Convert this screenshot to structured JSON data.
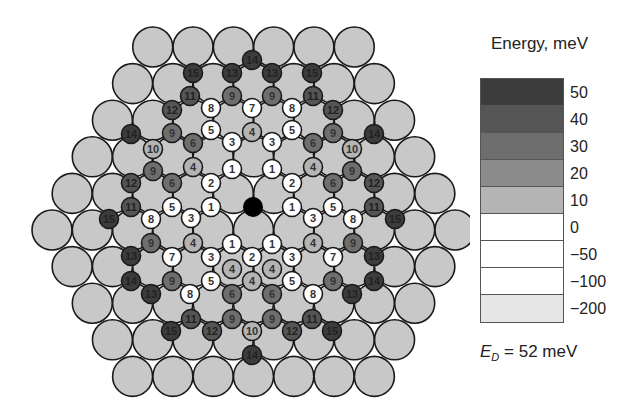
{
  "legend": {
    "title": "Energy, meV",
    "bins": [
      {
        "label": "50",
        "color": "#3c3c3c"
      },
      {
        "label": "40",
        "color": "#555555"
      },
      {
        "label": "30",
        "color": "#6e6e6e"
      },
      {
        "label": "20",
        "color": "#8c8c8c"
      },
      {
        "label": "10",
        "color": "#b4b4b4"
      },
      {
        "label": "0",
        "color": "#ffffff"
      },
      {
        "label": "−50",
        "color": "#ffffff"
      },
      {
        "label": "−100",
        "color": "#ffffff"
      },
      {
        "label": "−200",
        "color": "#e6e6e6"
      }
    ],
    "ed_symbol": "E",
    "ed_sub": "D",
    "ed_value": "= 52 meV"
  },
  "lattice": {
    "substrate_color": "#c8c8c8",
    "row_counts": [
      6,
      7,
      8,
      9,
      10,
      11,
      10,
      9,
      8,
      7
    ],
    "top_y": 47,
    "row_step": 36.6,
    "col_step": 40.3,
    "center_x": 253.5,
    "radius": 20
  },
  "center_atom": {
    "x": 253,
    "y": 207,
    "color": "#000000"
  },
  "sites": [
    {
      "x": 252,
      "y": 60,
      "n": 14
    },
    {
      "x": 193,
      "y": 73,
      "n": 15
    },
    {
      "x": 232,
      "y": 73,
      "n": 13
    },
    {
      "x": 272,
      "y": 73,
      "n": 13
    },
    {
      "x": 312,
      "y": 73,
      "n": 15
    },
    {
      "x": 190,
      "y": 96,
      "n": 11
    },
    {
      "x": 232,
      "y": 96,
      "n": 9
    },
    {
      "x": 272,
      "y": 96,
      "n": 9
    },
    {
      "x": 313,
      "y": 96,
      "n": 11
    },
    {
      "x": 172,
      "y": 110,
      "n": 12
    },
    {
      "x": 211,
      "y": 108,
      "n": 8
    },
    {
      "x": 252,
      "y": 108,
      "n": 7
    },
    {
      "x": 292,
      "y": 108,
      "n": 8
    },
    {
      "x": 333,
      "y": 110,
      "n": 12
    },
    {
      "x": 131,
      "y": 134,
      "n": 14
    },
    {
      "x": 172,
      "y": 133,
      "n": 9
    },
    {
      "x": 211,
      "y": 130,
      "n": 5
    },
    {
      "x": 252,
      "y": 132,
      "n": 4
    },
    {
      "x": 292,
      "y": 130,
      "n": 5
    },
    {
      "x": 333,
      "y": 133,
      "n": 9
    },
    {
      "x": 374,
      "y": 134,
      "n": 14
    },
    {
      "x": 153,
      "y": 149,
      "n": 10
    },
    {
      "x": 193,
      "y": 143,
      "n": 6
    },
    {
      "x": 232,
      "y": 142,
      "n": 3
    },
    {
      "x": 272,
      "y": 142,
      "n": 3
    },
    {
      "x": 313,
      "y": 143,
      "n": 6
    },
    {
      "x": 352,
      "y": 149,
      "n": 10
    },
    {
      "x": 153,
      "y": 171,
      "n": 9
    },
    {
      "x": 193,
      "y": 167,
      "n": 4
    },
    {
      "x": 232,
      "y": 169,
      "n": 1
    },
    {
      "x": 272,
      "y": 169,
      "n": 1
    },
    {
      "x": 313,
      "y": 167,
      "n": 4
    },
    {
      "x": 352,
      "y": 171,
      "n": 9
    },
    {
      "x": 131,
      "y": 183,
      "n": 12
    },
    {
      "x": 172,
      "y": 183,
      "n": 6
    },
    {
      "x": 211,
      "y": 183,
      "n": 2
    },
    {
      "x": 292,
      "y": 183,
      "n": 2
    },
    {
      "x": 333,
      "y": 183,
      "n": 6
    },
    {
      "x": 374,
      "y": 183,
      "n": 12
    },
    {
      "x": 131,
      "y": 207,
      "n": 11
    },
    {
      "x": 172,
      "y": 207,
      "n": 5
    },
    {
      "x": 211,
      "y": 207,
      "n": 1
    },
    {
      "x": 292,
      "y": 207,
      "n": 1
    },
    {
      "x": 333,
      "y": 207,
      "n": 5
    },
    {
      "x": 374,
      "y": 207,
      "n": 11
    },
    {
      "x": 109,
      "y": 219,
      "n": 15
    },
    {
      "x": 151,
      "y": 219,
      "n": 8
    },
    {
      "x": 191,
      "y": 218,
      "n": 3
    },
    {
      "x": 313,
      "y": 218,
      "n": 3
    },
    {
      "x": 353,
      "y": 219,
      "n": 8
    },
    {
      "x": 395,
      "y": 219,
      "n": 15
    },
    {
      "x": 232,
      "y": 244,
      "n": 1
    },
    {
      "x": 272,
      "y": 244,
      "n": 1
    },
    {
      "x": 151,
      "y": 243,
      "n": 9
    },
    {
      "x": 193,
      "y": 243,
      "n": 4
    },
    {
      "x": 313,
      "y": 243,
      "n": 4
    },
    {
      "x": 353,
      "y": 243,
      "n": 9
    },
    {
      "x": 131,
      "y": 256,
      "n": 13
    },
    {
      "x": 172,
      "y": 257,
      "n": 7
    },
    {
      "x": 211,
      "y": 257,
      "n": 3
    },
    {
      "x": 252,
      "y": 257,
      "n": 2
    },
    {
      "x": 292,
      "y": 257,
      "n": 3
    },
    {
      "x": 333,
      "y": 257,
      "n": 7
    },
    {
      "x": 374,
      "y": 256,
      "n": 13
    },
    {
      "x": 131,
      "y": 281,
      "n": 14
    },
    {
      "x": 172,
      "y": 281,
      "n": 9
    },
    {
      "x": 211,
      "y": 281,
      "n": 5
    },
    {
      "x": 232,
      "y": 269,
      "n": 4
    },
    {
      "x": 252,
      "y": 281,
      "n": 4
    },
    {
      "x": 272,
      "y": 269,
      "n": 4
    },
    {
      "x": 292,
      "y": 281,
      "n": 5
    },
    {
      "x": 333,
      "y": 281,
      "n": 9
    },
    {
      "x": 374,
      "y": 281,
      "n": 14
    },
    {
      "x": 151,
      "y": 294,
      "n": 13
    },
    {
      "x": 190,
      "y": 294,
      "n": 8
    },
    {
      "x": 232,
      "y": 294,
      "n": 6
    },
    {
      "x": 272,
      "y": 294,
      "n": 6
    },
    {
      "x": 313,
      "y": 294,
      "n": 8
    },
    {
      "x": 352,
      "y": 294,
      "n": 13
    },
    {
      "x": 191,
      "y": 319,
      "n": 11
    },
    {
      "x": 232,
      "y": 319,
      "n": 9
    },
    {
      "x": 272,
      "y": 319,
      "n": 9
    },
    {
      "x": 312,
      "y": 319,
      "n": 11
    },
    {
      "x": 171,
      "y": 331,
      "n": 15
    },
    {
      "x": 212,
      "y": 331,
      "n": 12
    },
    {
      "x": 252,
      "y": 331,
      "n": 10
    },
    {
      "x": 292,
      "y": 331,
      "n": 12
    },
    {
      "x": 332,
      "y": 331,
      "n": 15
    },
    {
      "x": 252,
      "y": 355,
      "n": 14
    }
  ]
}
